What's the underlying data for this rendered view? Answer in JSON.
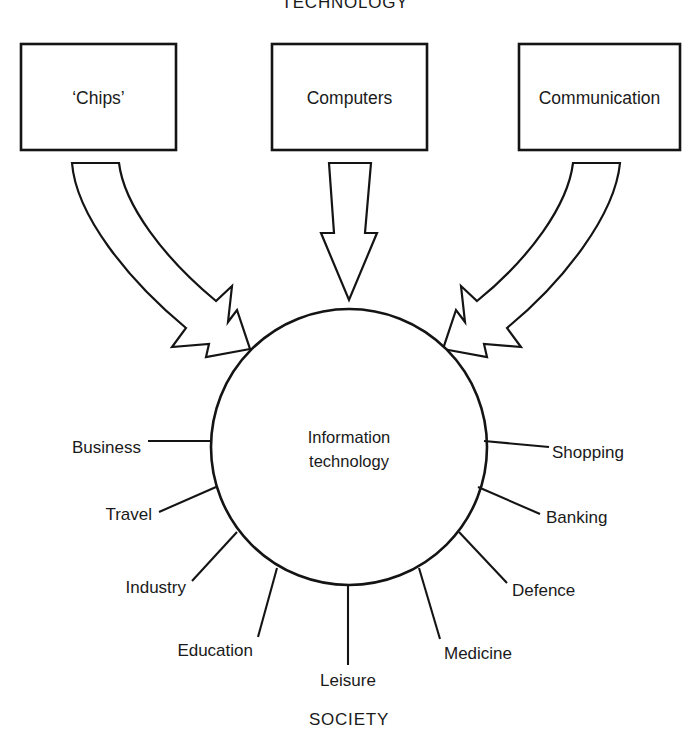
{
  "diagram": {
    "top_heading": "TECHNOLOGY",
    "bottom_heading": "SOCIETY",
    "hub": {
      "line1": "Information",
      "line2": "technology"
    },
    "source_boxes": [
      {
        "label": "‘Chips’",
        "arrow": "curved-arrow-down-right"
      },
      {
        "label": "Computers",
        "arrow": "straight-arrow-down"
      },
      {
        "label": "Communication",
        "arrow": "curved-arrow-down-left"
      }
    ],
    "spokes_left": [
      {
        "label": "Business"
      },
      {
        "label": "Travel"
      },
      {
        "label": "Industry"
      },
      {
        "label": "Education"
      }
    ],
    "spokes_bottom": [
      {
        "label": "Leisure"
      }
    ],
    "spokes_right": [
      {
        "label": "Shopping"
      },
      {
        "label": "Banking"
      },
      {
        "label": "Defence"
      },
      {
        "label": "Medicine"
      }
    ],
    "colors": {
      "stroke": "#141414",
      "fill": "#ffffff",
      "text": "#1a1a1a"
    }
  }
}
